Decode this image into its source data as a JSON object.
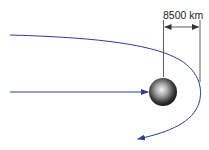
{
  "diagram": {
    "distance_label": "8500 km",
    "colors": {
      "trajectory": "#2b3f9a",
      "dimension": "#333333",
      "planet_light": "#f2f2f2",
      "planet_dark": "#1a1a1a"
    }
  }
}
